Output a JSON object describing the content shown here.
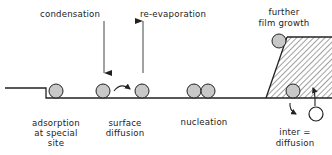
{
  "diagram": {
    "colors": {
      "line": "#222222",
      "atom_fill": "#c8c8c8",
      "open_atom_fill": "#ffffff",
      "hatch": "#444444",
      "text": "#222222"
    },
    "labels": {
      "condensation": "condensation",
      "re_evaporation": "re-evaporation",
      "further_1": "further",
      "further_2": "film growth",
      "adsorption_1": "adsorption",
      "adsorption_2": "at special",
      "adsorption_3": "site",
      "surface_1": "surface",
      "surface_2": "diffusion",
      "nucleation": "nucleation",
      "inter_1": "inter =",
      "inter_2": "diffusion"
    },
    "nodes": [
      {
        "id": "adsorbed-atom",
        "type": "atom"
      },
      {
        "id": "diffusing-atom-start",
        "type": "atom"
      },
      {
        "id": "diffusing-atom-end",
        "type": "atom"
      },
      {
        "id": "nucleation-atom-1",
        "type": "atom"
      },
      {
        "id": "nucleation-atom-2",
        "type": "atom"
      },
      {
        "id": "film-edge-atom",
        "type": "atom"
      },
      {
        "id": "film-inner-atom",
        "type": "atom"
      },
      {
        "id": "interdiffusing-atom",
        "type": "open-atom"
      },
      {
        "id": "film",
        "type": "hatched-region"
      },
      {
        "id": "substrate",
        "type": "surface-with-step"
      }
    ],
    "edges": [
      {
        "from": "condensation",
        "to": "surface",
        "kind": "arrow-down"
      },
      {
        "from": "surface",
        "to": "re-evaporation",
        "kind": "arrow-up"
      },
      {
        "from": "diffusing-atom-start",
        "to": "diffusing-atom-end",
        "kind": "curved-arrow"
      },
      {
        "from": "film-inner-atom",
        "to": "substrate",
        "kind": "curved-arrow-down"
      },
      {
        "from": "interdiffusing-atom",
        "to": "film",
        "kind": "arrow-up"
      }
    ]
  }
}
